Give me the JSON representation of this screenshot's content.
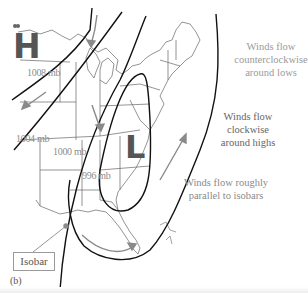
{
  "diagram": {
    "panel_label": "(b)",
    "high_symbol": "H",
    "low_symbol": "L",
    "isobar_labels": [
      "1008 mb",
      "1004 mb",
      "1000 mb",
      "996 mb"
    ],
    "callout": "Isobar",
    "annotations": {
      "lows": "Winds flow counterclockwise around lows",
      "lows_lines": [
        "Winds flow",
        "counterclockwise",
        "around lows"
      ],
      "highs_lines": [
        "Winds flow",
        "clockwise",
        "around highs"
      ],
      "parallel_lines": [
        "Winds flow roughly",
        "parallel to isobars"
      ]
    },
    "colors": {
      "isobar": "#111111",
      "wind_arrow": "#8a8a8a",
      "map_outline": "#555555",
      "letter": "#555555",
      "text": "#8a8a8a"
    }
  }
}
